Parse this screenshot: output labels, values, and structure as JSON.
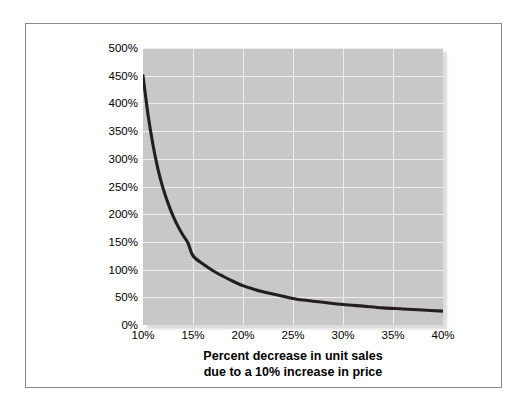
{
  "figure": {
    "border_color": "#8a8a8a",
    "background": "#ffffff"
  },
  "chart_data": {
    "type": "line",
    "title": "",
    "subtitle": "",
    "xlabel": "Percent decrease in unit sales due to a 10% increase in price",
    "xlabel_lines": [
      "Percent decrease in unit sales",
      "due to a 10% increase in price"
    ],
    "ylabel": "Optimal markup on variable cost",
    "xlim": [
      10,
      40
    ],
    "ylim": [
      0,
      500
    ],
    "xticks": [
      10,
      15,
      20,
      25,
      30,
      35,
      40
    ],
    "yticks": [
      0,
      50,
      100,
      150,
      200,
      250,
      300,
      350,
      400,
      450,
      500
    ],
    "xtick_labels": [
      "10%",
      "15%",
      "20%",
      "25%",
      "30%",
      "35%",
      "40%"
    ],
    "ytick_labels": [
      "0%",
      "50%",
      "100%",
      "150%",
      "200%",
      "250%",
      "300%",
      "350%",
      "400%",
      "450%",
      "500%"
    ],
    "grid": true,
    "grid_color": "#eeeeee",
    "plot_background": "#c8c8c8",
    "legend": "none",
    "series": [
      {
        "name": "Optimal markup on variable cost",
        "color": "#231f20",
        "line_width": 3,
        "x": [
          10,
          10.5,
          11,
          11.5,
          12,
          12.5,
          13,
          13.5,
          14,
          14.5,
          15,
          16,
          17,
          18,
          19,
          20,
          21,
          22,
          23,
          24,
          25,
          26,
          27,
          28,
          30,
          32,
          34,
          36,
          38,
          40
        ],
        "y": [
          450,
          380,
          325,
          281,
          247,
          220,
          197,
          178,
          162,
          148,
          125,
          110,
          98,
          88,
          79,
          71,
          65,
          60,
          56,
          52,
          48,
          45,
          43,
          41,
          37,
          34,
          31,
          29,
          27,
          25
        ]
      }
    ]
  }
}
